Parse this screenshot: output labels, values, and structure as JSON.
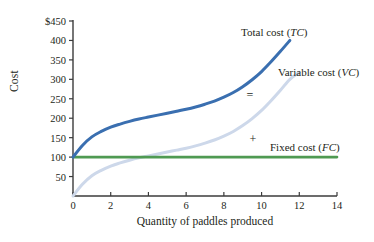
{
  "chart_data": {
    "type": "line",
    "title": "",
    "xlabel": "Quantity of paddles produced",
    "ylabel": "Cost",
    "xlim": [
      0,
      14
    ],
    "ylim": [
      0,
      450
    ],
    "grid": false,
    "legend_position": "inline-right",
    "x_ticks": [
      "0",
      "2",
      "4",
      "6",
      "8",
      "10",
      "12",
      "14"
    ],
    "x_tick_values": [
      0,
      2,
      4,
      6,
      8,
      10,
      12,
      14
    ],
    "y_ticks": [
      "50",
      "100",
      "150",
      "200",
      "250",
      "300",
      "350",
      "400",
      "$450"
    ],
    "y_tick_values": [
      50,
      100,
      150,
      200,
      250,
      300,
      350,
      400,
      450
    ],
    "series": [
      {
        "name": "Total cost (TC)",
        "label_text": "Total cost (",
        "label_italic": "TC",
        "label_tail": ")",
        "color": "#3a6fb0",
        "x": [
          0,
          0.5,
          1,
          1.5,
          2,
          2.5,
          3,
          3.5,
          4,
          4.5,
          5,
          5.5,
          6,
          6.5,
          7,
          7.5,
          8,
          8.5,
          9,
          9.5,
          10,
          10.5,
          11,
          11.5
        ],
        "values": [
          100,
          130,
          152,
          166,
          177,
          185,
          192,
          198,
          203,
          208,
          213,
          218,
          223,
          229,
          236,
          244,
          254,
          266,
          281,
          299,
          320,
          345,
          372,
          400
        ]
      },
      {
        "name": "Variable cost (VC)",
        "label_text": "Variable cost (",
        "label_italic": "VC",
        "label_tail": ")",
        "color": "#cdd8ea",
        "x": [
          0,
          0.5,
          1,
          1.5,
          2,
          2.5,
          3,
          3.5,
          4,
          4.5,
          5,
          5.5,
          6,
          6.5,
          7,
          7.5,
          8,
          8.5,
          9,
          9.5,
          10,
          10.5,
          11,
          11.5,
          12
        ],
        "values": [
          0,
          30,
          52,
          66,
          77,
          85,
          92,
          98,
          103,
          108,
          113,
          118,
          123,
          129,
          136,
          144,
          154,
          166,
          181,
          199,
          220,
          245,
          272,
          300,
          318
        ]
      },
      {
        "name": "Fixed cost (FC)",
        "label_text": "Fixed cost (",
        "label_italic": "FC",
        "label_tail": ")",
        "color": "#4f9a52",
        "x": [
          0,
          14
        ],
        "values": [
          100,
          100
        ]
      }
    ],
    "annotations": [
      {
        "text": "=",
        "x": 10.0,
        "y": 268
      },
      {
        "text": "+",
        "x": 10.15,
        "y": 160
      }
    ]
  },
  "labels": {
    "total_cost": "Total cost (",
    "total_cost_italic": "TC",
    "total_cost_tail": ")",
    "variable_cost": "Variable cost (",
    "variable_cost_italic": "VC",
    "variable_cost_tail": ")",
    "fixed_cost": "Fixed cost (",
    "fixed_cost_italic": "FC",
    "fixed_cost_tail": ")",
    "equals_operator": "=",
    "plus_operator": "+"
  },
  "colors": {
    "total_cost": "#3a6fb0",
    "variable_cost": "#cdd8ea",
    "fixed_cost": "#4f9a52",
    "axis": "#3b3b3b",
    "text": "#231f20"
  }
}
